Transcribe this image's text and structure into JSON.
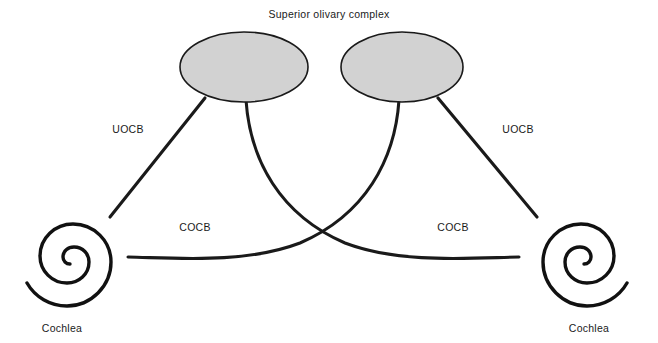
{
  "figure": {
    "title": "Superior olivary complex",
    "background_color": "#ffffff",
    "line_color": "#1a1a1a",
    "nucleus_fill_color": "#d2d2d2",
    "width": 658,
    "height": 343
  },
  "nuclei": [
    {
      "id": "left-superior-olivary-complex",
      "label": "Superior olivary complex",
      "cx": 244,
      "cy": 67,
      "rx": 64,
      "ry": 35
    },
    {
      "id": "right-superior-olivary-complex",
      "label": "Superior olivary complex",
      "cx": 402,
      "cy": 67,
      "rx": 61,
      "ry": 35
    }
  ],
  "pathways": [
    {
      "id": "uocb-left",
      "label": "UOCB",
      "full_name": "Uncrossed olivocochlear bundle",
      "side": "left",
      "label_x": 128,
      "label_y": 133
    },
    {
      "id": "uocb-right",
      "label": "UOCB",
      "full_name": "Uncrossed olivocochlear bundle",
      "side": "right",
      "label_x": 518,
      "label_y": 133
    },
    {
      "id": "cocb-left",
      "label": "COCB",
      "full_name": "Crossed olivocochlear bundle",
      "side": "left",
      "label_x": 195,
      "label_y": 231
    },
    {
      "id": "cocb-right",
      "label": "COCB",
      "full_name": "Crossed olivocochlear bundle",
      "side": "right",
      "label_x": 453,
      "label_y": 231
    }
  ],
  "organs": [
    {
      "id": "cochlea-left",
      "label": "Cochlea",
      "label_x": 62,
      "label_y": 330,
      "cx": 70,
      "cy": 262
    },
    {
      "id": "cochlea-right",
      "label": "Cochlea",
      "label_x": 589,
      "label_y": 330,
      "cx": 584,
      "cy": 262
    }
  ]
}
